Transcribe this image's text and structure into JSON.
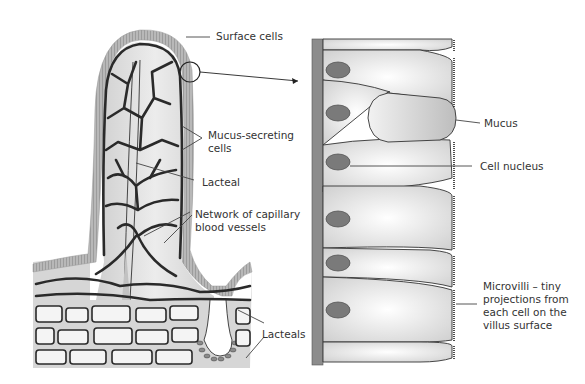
{
  "diagram": {
    "left_panel": {
      "name": "Villus cross-section",
      "labels": {
        "surface_cells": "Surface cells",
        "mucus_secreting_1": "Mucus-secreting",
        "mucus_secreting_2": "cells",
        "lacteal": "Lacteal",
        "network_1": "Network of capillary",
        "network_2": "blood vessels",
        "lacteals": "Lacteals"
      }
    },
    "right_panel": {
      "name": "Magnified epithelial cells",
      "labels": {
        "mucus": "Mucus",
        "cell_nucleus": "Cell nucleus",
        "microvilli_1": "Microvilli – tiny",
        "microvilli_2": "projections from",
        "microvilli_3": "each cell on the",
        "microvilli_4": "villus surface"
      }
    },
    "colors": {
      "tissue_fill": "#d9d9d9",
      "surface_cells": "#b3b3b3",
      "vessel": "#2a2a2a",
      "nucleus": "#7a7a7a",
      "basement": "#8c8c8c"
    }
  }
}
